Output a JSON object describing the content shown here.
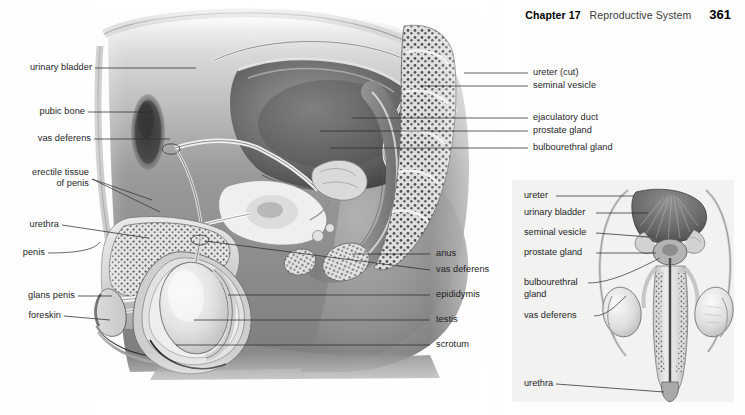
{
  "running_head": {
    "chapter": "Chapter 17",
    "section": "Reproductive System",
    "page_number": "361"
  },
  "figure": {
    "type": "anatomical-illustration",
    "view": "sagittal-section-male-pelvis",
    "rendering": "grayscale-airbrush-pencil",
    "labels_left": [
      {
        "id": "urinary-bladder",
        "text": "urinary bladder"
      },
      {
        "id": "pubic-bone",
        "text": "pubic bone"
      },
      {
        "id": "vas-deferens",
        "text": "vas deferens"
      },
      {
        "id": "erectile-tissue",
        "text": "erectile tissue\nof penis"
      },
      {
        "id": "urethra",
        "text": "urethra"
      },
      {
        "id": "penis",
        "text": "penis"
      },
      {
        "id": "glans-penis",
        "text": "glans penis"
      },
      {
        "id": "foreskin",
        "text": "foreskin"
      }
    ],
    "labels_right": [
      {
        "id": "ureter-cut",
        "text": "ureter (cut)"
      },
      {
        "id": "seminal-vesicle",
        "text": "seminal vesicle"
      },
      {
        "id": "ejaculatory-duct",
        "text": "ejaculatory duct"
      },
      {
        "id": "prostate-gland",
        "text": "prostate gland"
      },
      {
        "id": "bulbourethral-gland",
        "text": "bulbourethral gland"
      },
      {
        "id": "anus",
        "text": "anus"
      },
      {
        "id": "vas-deferens-2",
        "text": "vas deferens"
      },
      {
        "id": "epididymis",
        "text": "epididymis"
      },
      {
        "id": "testis",
        "text": "testis"
      },
      {
        "id": "scrotum",
        "text": "scrotum"
      }
    ]
  },
  "inset": {
    "type": "anatomical-illustration",
    "view": "anterior-view-male-reproductive-organs",
    "background_color": "#f2f2f1",
    "labels": [
      {
        "id": "ureter",
        "text": "ureter"
      },
      {
        "id": "urinary-bladder",
        "text": "urinary bladder"
      },
      {
        "id": "seminal-vesicle",
        "text": "seminal vesicle"
      },
      {
        "id": "prostate-gland",
        "text": "prostate gland"
      },
      {
        "id": "bulbourethral-gland",
        "text": "bulbourethral\ngland"
      },
      {
        "id": "vas-deferens",
        "text": "vas deferens"
      },
      {
        "id": "urethra",
        "text": "urethra"
      }
    ]
  },
  "colors": {
    "page_background": "#fdfdfd",
    "label_text": "#1d1d1d",
    "leader_line": "#2b2b2b",
    "inset_panel": "#f2f2f1",
    "page_number": "#000000"
  }
}
